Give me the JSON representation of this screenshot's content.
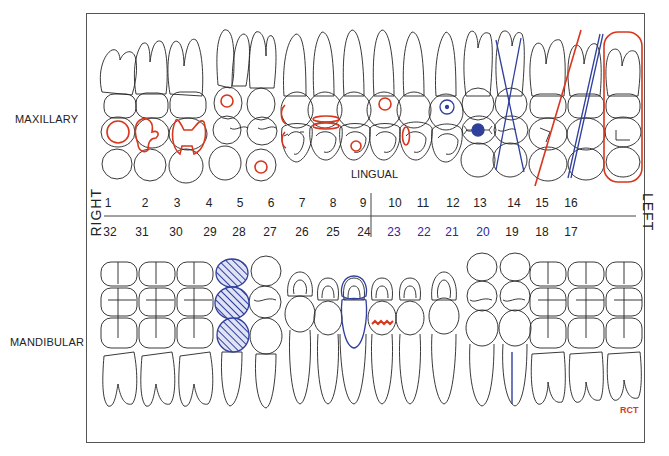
{
  "labels": {
    "maxillary": "MAXILLARY",
    "mandibular": "MANDIBULAR",
    "lingual": "LINGUAL",
    "right": "RIGHT",
    "left": "LEFT",
    "rct": "RCT"
  },
  "colors": {
    "red_marking": "#d8371e",
    "blue_marking": "#2f3f9c",
    "outline": "#222222",
    "border": "#555555"
  },
  "upper_numbers": [
    "1",
    "2",
    "3",
    "4",
    "5",
    "6",
    "7",
    "8",
    "9",
    "10",
    "11",
    "12",
    "13",
    "14",
    "15",
    "16"
  ],
  "lower_numbers": [
    "32",
    "31",
    "30",
    "29",
    "28",
    "27",
    "26",
    "25",
    "24",
    "23",
    "22",
    "21",
    "20",
    "19",
    "18",
    "17"
  ],
  "lower_numbers_blue": [
    "23",
    "22",
    "21",
    "20"
  ],
  "markings": {
    "maxillary": [
      {
        "tooth": "1",
        "mark": "red circle (occlusal)"
      },
      {
        "tooth": "2",
        "mark": "red outlined restoration"
      },
      {
        "tooth": "3",
        "mark": "red outlined restoration (MOD)"
      },
      {
        "tooth": "4",
        "mark": "red circle (facial)"
      },
      {
        "tooth": "5",
        "mark": "red circle (lingual)"
      },
      {
        "tooth": "6",
        "mark": "red interproximal marks"
      },
      {
        "tooth": "7",
        "mark": "red double band"
      },
      {
        "tooth": "8",
        "mark": "red circle (lingual)"
      },
      {
        "tooth": "9",
        "mark": "red circle (facial)"
      },
      {
        "tooth": "10",
        "mark": "red interproximal mark"
      },
      {
        "tooth": "11",
        "mark": "blue dotted circle"
      },
      {
        "tooth": "12",
        "mark": "blue filled dot"
      },
      {
        "tooth": "13",
        "mark": "blue X (extracted)"
      },
      {
        "tooth": "14",
        "mark": "red slash (to be extracted)"
      },
      {
        "tooth": "15",
        "mark": "blue double slash"
      },
      {
        "tooth": "16",
        "mark": "red outline (whole tooth)"
      }
    ],
    "mandibular": [
      {
        "tooth": "29",
        "mark": "blue hatched crown"
      },
      {
        "tooth": "25",
        "mark": "blue crown outline"
      },
      {
        "tooth": "24",
        "mark": "red zigzag (fracture)"
      },
      {
        "tooth": "20",
        "mark": "blue root canal line"
      }
    ]
  }
}
